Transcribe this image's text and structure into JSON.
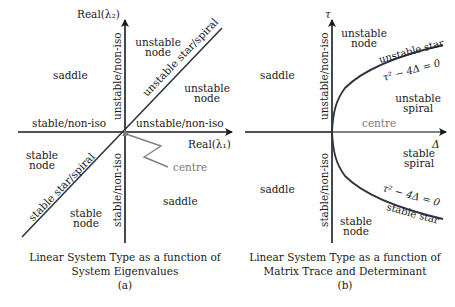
{
  "colors": {
    "axis": "#1a1a1a",
    "boundary": "#3a4250",
    "centre": "#808080",
    "text": "#1a1a1a"
  },
  "panel_a": {
    "axis_x_label": "Real(λ₁)",
    "axis_y_label": "Real(λ₂)",
    "regions": {
      "upper_left": "saddle",
      "upper_node_line1": "unstable",
      "upper_node_line2": "node",
      "right_node_line1": "unstable",
      "right_node_line2": "node",
      "diag_upper": "unstable star/spiral",
      "y_pos_axis": "unstable/non-iso",
      "x_pos_axis": "unstable/non-iso",
      "x_neg_axis": "stable/non-iso",
      "y_neg_axis": "stable/non-iso",
      "diag_lower": "stable star/spiral",
      "left_node_line1": "stable",
      "left_node_line2": "node",
      "lower_node_line1": "stable",
      "lower_node_line2": "node",
      "lower_right": "saddle",
      "centre": "centre"
    },
    "caption_line1": "Linear System Type as a function of",
    "caption_line2": "System Eigenvalues",
    "caption_tag": "(a)"
  },
  "panel_b": {
    "axis_x_label": "Δ",
    "axis_y_label": "τ",
    "regions": {
      "upper_left": "saddle",
      "lower_left": "saddle",
      "upper_node_line1": "unstable",
      "upper_node_line2": "node",
      "upper_star": "unstable star",
      "upper_eq": "τ² − 4Δ = 0",
      "unstable_spiral_line1": "unstable",
      "unstable_spiral_line2": "spiral",
      "centre": "centre",
      "stable_spiral_line1": "stable",
      "stable_spiral_line2": "spiral",
      "lower_eq": "τ² − 4Δ = 0",
      "lower_star": "stable star",
      "lower_node_line1": "stable",
      "lower_node_line2": "node",
      "y_pos_axis": "unstable/non-iso",
      "y_neg_axis": "stable/non-iso"
    },
    "caption_line1": "Linear System Type as a function of",
    "caption_line2": "Matrix Trace and Determinant",
    "caption_tag": "(b)"
  }
}
